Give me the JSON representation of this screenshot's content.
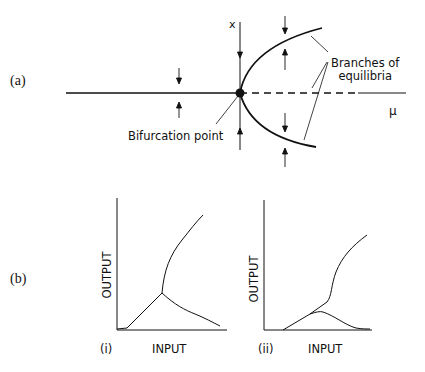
{
  "panel_a": {
    "label": "(a)",
    "x_axis_label": "x",
    "mu_label": "μ",
    "annotation_branches_line1": "Branches of",
    "annotation_branches_line2": "equilibria",
    "annotation_bifurcation": "Bifurcation point"
  },
  "panel_b": {
    "label": "(b)",
    "subplots": [
      {
        "label": "(i)",
        "xlabel": "INPUT",
        "ylabel": "OUTPUT"
      },
      {
        "label": "(ii)",
        "xlabel": "INPUT",
        "ylabel": "OUTPUT"
      }
    ]
  },
  "colors": {
    "ink": "#111111",
    "background": "#ffffff"
  }
}
